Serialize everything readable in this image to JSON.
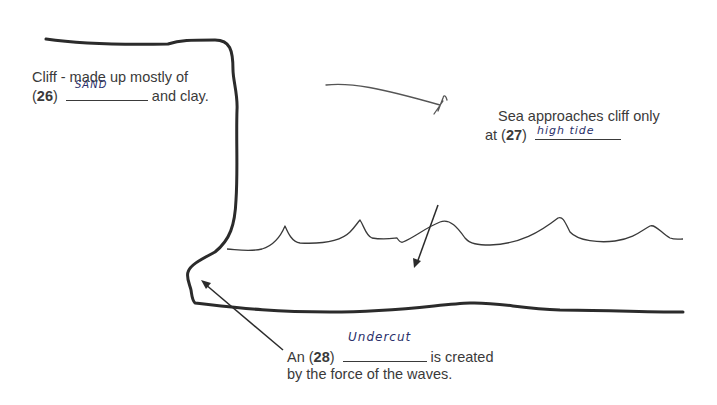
{
  "diagram": {
    "labels": {
      "q26": {
        "line1": "Cliff - made up mostly of",
        "number": "26",
        "suffix": "and clay.",
        "answer": "SAND"
      },
      "q27": {
        "line1": "Sea approaches cliff only",
        "prefix": "at (",
        "number": "27",
        "answer": "high tide"
      },
      "q28": {
        "prefix": "An (",
        "number": "28",
        "suffix": "is created",
        "line2": "by the force of the waves.",
        "answer": "Undercut"
      }
    },
    "elements": [
      "cliff-outline",
      "sea-wave-line",
      "beach-line",
      "arrow-to-sea",
      "arrow-to-undercut",
      "stray-pen-mark"
    ]
  }
}
